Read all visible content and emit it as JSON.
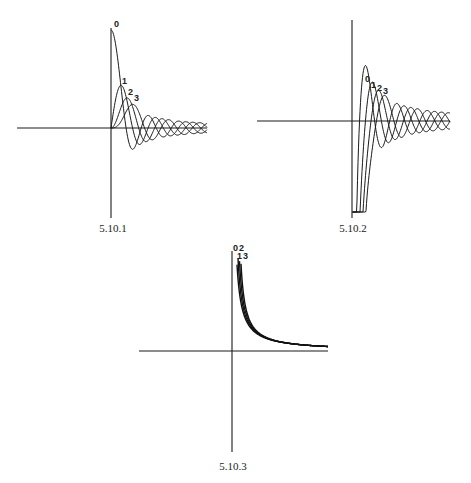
{
  "chart_data": [
    {
      "id": "5.10.1",
      "type": "line",
      "title": "",
      "caption": "5.10.1",
      "description": "Spherical Bessel functions of the first kind j_n(x), n = 0,1,2,3",
      "xlabel": "",
      "ylabel": "",
      "grid": false,
      "legend": "inline curve labels",
      "series": [
        {
          "name": "0",
          "function": "j0",
          "peak_x": 0,
          "peak_y": 1.0
        },
        {
          "name": "1",
          "function": "j1",
          "peak_x": 2.08,
          "peak_y": 0.436
        },
        {
          "name": "2",
          "function": "j2",
          "peak_x": 3.34,
          "peak_y": 0.307
        },
        {
          "name": "3",
          "function": "j3",
          "peak_x": 4.51,
          "peak_y": 0.242
        }
      ],
      "xlim": [
        -20,
        20
      ],
      "ylim": [
        -1,
        1
      ],
      "layout": {
        "ox": 111,
        "oy": 128,
        "xl": 17,
        "xr": 207,
        "yt": 28,
        "yb": 218,
        "xscale": 4.8,
        "yscale": 98,
        "cap_x": 113,
        "cap_y": 232
      },
      "labels": [
        {
          "text": "0",
          "x": 114,
          "y": 27
        },
        {
          "text": "1",
          "x": 122,
          "y": 84
        },
        {
          "text": "2",
          "x": 128,
          "y": 95
        },
        {
          "text": "3",
          "x": 134,
          "y": 101
        }
      ]
    },
    {
      "id": "5.10.2",
      "type": "line",
      "title": "",
      "caption": "5.10.2",
      "description": "Spherical Bessel functions of the second kind y_n(x), n = 0,1,2,3",
      "xlabel": "",
      "ylabel": "",
      "grid": false,
      "legend": "inline curve labels",
      "series": [
        {
          "name": "0",
          "function": "y0",
          "peak_x": 3.0,
          "peak_y": 0.33
        },
        {
          "name": "1",
          "function": "y1",
          "peak_x": 4.3,
          "peak_y": 0.25
        },
        {
          "name": "2",
          "function": "y2",
          "peak_x": 5.5,
          "peak_y": 0.21
        },
        {
          "name": "3",
          "function": "y3",
          "peak_x": 6.7,
          "peak_y": 0.18
        }
      ],
      "xlim": [
        -20,
        20
      ],
      "ylim": [
        -1,
        1
      ],
      "layout": {
        "ox": 352,
        "oy": 121,
        "xl": 257,
        "xr": 450,
        "yt": 20,
        "yb": 218,
        "xscale": 4.8,
        "yscale": 165,
        "clip_bottom": 212,
        "cap_x": 353,
        "cap_y": 232
      },
      "labels": [
        {
          "text": "0",
          "x": 365,
          "y": 82
        },
        {
          "text": "1",
          "x": 371,
          "y": 88
        },
        {
          "text": "2",
          "x": 377,
          "y": 91
        },
        {
          "text": "3",
          "x": 383,
          "y": 94
        }
      ]
    },
    {
      "id": "5.10.3",
      "type": "line",
      "title": "",
      "caption": "5.10.3",
      "description": "Monotonically decaying family of curves n = 0,1,2,3 (diverging at x→0+)",
      "xlabel": "",
      "ylabel": "",
      "grid": false,
      "legend": "inline curve labels",
      "series": [
        {
          "name": "0",
          "function": "decay",
          "offset": 0.0
        },
        {
          "name": "1",
          "function": "decay",
          "offset": 0.05
        },
        {
          "name": "2",
          "function": "decay",
          "offset": 0.1
        },
        {
          "name": "3",
          "function": "decay",
          "offset": 0.15
        }
      ],
      "xlim": [
        -20,
        20
      ],
      "ylim": [
        -1,
        1
      ],
      "layout": {
        "ox": 232,
        "oy": 351,
        "xl": 139,
        "xr": 328,
        "yt": 251,
        "yb": 452,
        "xscale": 4.8,
        "yscale": 100,
        "clip_top": 256,
        "cap_x": 233,
        "cap_y": 470
      },
      "labels": [
        {
          "text": "0",
          "x": 233,
          "y": 251
        },
        {
          "text": "2",
          "x": 239,
          "y": 251
        },
        {
          "text": "1",
          "x": 237,
          "y": 259
        },
        {
          "text": "3",
          "x": 243,
          "y": 259
        }
      ]
    }
  ]
}
